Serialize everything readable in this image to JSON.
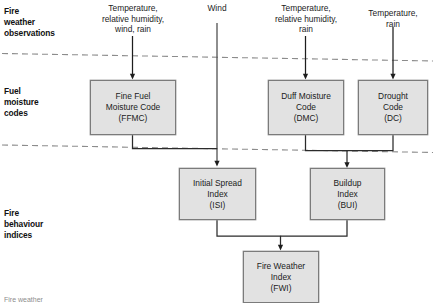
{
  "figure": {
    "caption": "Fire weather"
  },
  "row_labels": [
    {
      "id": "fire-weather-observations",
      "text": "Fire\nweather\nobservations"
    },
    {
      "id": "fuel-moisture-codes",
      "text": "Fuel\nmoisture\ncodes"
    },
    {
      "id": "fire-behaviour-indices",
      "text": "Fire\nbehaviour\nindices"
    }
  ],
  "inputs": [
    {
      "id": "input-ffmc",
      "text": "Temperature,\nrelative humidity,\nwind, rain"
    },
    {
      "id": "input-wind",
      "text": "Wind"
    },
    {
      "id": "input-dmc",
      "text": "Temperature,\nrelative humidity,\nrain"
    },
    {
      "id": "input-dc",
      "text": "Temperature,\nrain"
    }
  ],
  "nodes": [
    {
      "id": "ffmc",
      "text": "Fine Fuel\nMoisture Code\n(FFMC)",
      "abbr": "FFMC"
    },
    {
      "id": "dmc",
      "text": "Duff Moisture\nCode\n(DMC)",
      "abbr": "DMC"
    },
    {
      "id": "dc",
      "text": "Drought\nCode\n(DC)",
      "abbr": "DC"
    },
    {
      "id": "isi",
      "text": "Initial Spread\nIndex\n(ISI)",
      "abbr": "ISI"
    },
    {
      "id": "bui",
      "text": "Buildup\nIndex\n(BUI)",
      "abbr": "BUI"
    },
    {
      "id": "fwi",
      "text": "Fire Weather\nIndex\n(FWI)",
      "abbr": "FWI"
    }
  ],
  "colors": {
    "box_fill": "#e2e2e2",
    "box_stroke": "#7b7b7b",
    "line": "#2b2b2b",
    "divider": "#8c8c8c",
    "text": "#1b1b1b"
  }
}
